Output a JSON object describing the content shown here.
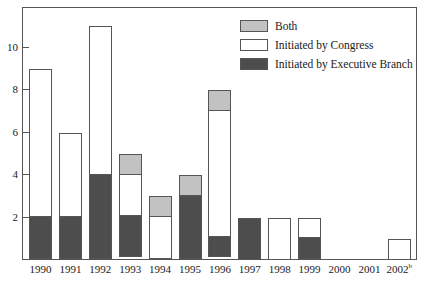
{
  "chart_data": {
    "type": "bar",
    "title": "",
    "subtitle": "",
    "xlabel": "",
    "ylabel": "",
    "stacked": true,
    "grid": false,
    "legend_position": "top-right",
    "ylim": [
      0,
      12
    ],
    "yticks": [
      2,
      4,
      6,
      8,
      10
    ],
    "ytick_labels": [
      "2",
      "4",
      "6",
      "8",
      "10"
    ],
    "categories": [
      "1990",
      "1991",
      "1992",
      "1993",
      "1994",
      "1995",
      "1996",
      "1997",
      "1998",
      "1999",
      "2000",
      "2001",
      "2002"
    ],
    "category_superscripts": [
      "",
      "",
      "",
      "",
      "",
      "",
      "",
      "",
      "",
      "",
      "",
      "",
      "b"
    ],
    "series": [
      {
        "name": "Initiated by Executive Branch",
        "color": "#4d4d4d",
        "values": [
          2,
          2,
          4,
          2,
          0,
          3,
          1,
          2,
          0,
          1,
          0,
          0,
          0
        ]
      },
      {
        "name": "Initiated by Congress",
        "color": "#ffffff",
        "values": [
          7,
          4,
          7,
          2,
          2,
          0,
          6,
          0,
          2,
          1,
          0,
          0,
          1
        ]
      },
      {
        "name": "Both",
        "color": "#c2c2c2",
        "values": [
          0,
          0,
          0,
          1,
          1,
          1,
          1,
          0,
          0,
          0,
          0,
          0,
          0
        ]
      }
    ],
    "totals": [
      9,
      6,
      11,
      5,
      3,
      4,
      8,
      2,
      2,
      2,
      0,
      0,
      1
    ]
  },
  "legend": {
    "entries": [
      {
        "label": "Both",
        "swatch": "both"
      },
      {
        "label": "Initiated by Congress",
        "swatch": "congress"
      },
      {
        "label": "Initiated by Executive Branch",
        "swatch": "exec"
      }
    ]
  }
}
